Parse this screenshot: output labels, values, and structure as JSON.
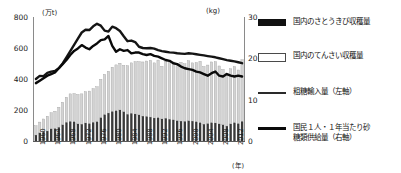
{
  "axes": {
    "left_unit": "(万t)",
    "right_unit": "(kg)",
    "x_unit": "(年)",
    "y_left_ticks": [
      "800",
      "600",
      "400",
      "200",
      "0"
    ],
    "y_right_ticks": [
      "30",
      "20",
      "10",
      "0"
    ],
    "x_ticks": [
      "1960",
      "1964",
      "1968",
      "1972",
      "1976",
      "1980",
      "1984",
      "1988",
      "1992",
      "1996",
      "2000",
      "2004",
      "2008",
      "2012"
    ]
  },
  "legend": {
    "items": [
      {
        "label": "国内のさとうきび収穫量",
        "key": "black-bar-swatch",
        "color": "#111111"
      },
      {
        "label": "国内のてんさい収穫量",
        "key": "white-bar-swatch",
        "color": "#ffffff"
      },
      {
        "label": "粗糖輸入量（左軸）",
        "key": "thin-line-swatch",
        "color": "#2a2a2a"
      },
      {
        "label": "国民１人・１年当たり砂\n糖類供給量（右軸）",
        "key": "thick-line-swatch",
        "color": "#0a0a0a"
      }
    ]
  },
  "chart_data": {
    "type": "bar",
    "title": "",
    "xlabel": "(年)",
    "ylabel": "(万t)",
    "ylabel_right": "(kg)",
    "ylim": [
      0,
      800
    ],
    "ylim_right": [
      0,
      30
    ],
    "grid": false,
    "legend_position": "right",
    "x": [
      1960,
      1961,
      1962,
      1963,
      1964,
      1965,
      1966,
      1967,
      1968,
      1969,
      1970,
      1971,
      1972,
      1973,
      1974,
      1975,
      1976,
      1977,
      1978,
      1979,
      1980,
      1981,
      1982,
      1983,
      1984,
      1985,
      1986,
      1987,
      1988,
      1989,
      1990,
      1991,
      1992,
      1993,
      1994,
      1995,
      1996,
      1997,
      1998,
      1999,
      2000,
      2001,
      2002,
      2003,
      2004,
      2005,
      2006,
      2007,
      2008,
      2009,
      2010,
      2011,
      2012,
      2013,
      2014
    ],
    "series": [
      {
        "name": "国内のさとうきび収穫量",
        "axis": "left",
        "unit": "万t",
        "style": "bar-black",
        "values": [
          38,
          52,
          60,
          64,
          78,
          80,
          88,
          104,
          120,
          126,
          124,
          110,
          108,
          116,
          112,
          120,
          124,
          150,
          170,
          180,
          190,
          195,
          200,
          188,
          172,
          178,
          174,
          168,
          160,
          158,
          154,
          148,
          150,
          142,
          146,
          140,
          136,
          130,
          128,
          126,
          130,
          128,
          124,
          118,
          108,
          112,
          118,
          116,
          110,
          104,
          96,
          110,
          118,
          112,
          126
        ]
      },
      {
        "name": "国内のてんさい収穫量",
        "axis": "left",
        "unit": "万t",
        "style": "bar-white",
        "values": [
          60,
          70,
          82,
          96,
          104,
          112,
          130,
          146,
          162,
          178,
          182,
          190,
          196,
          202,
          210,
          218,
          226,
          248,
          260,
          270,
          286,
          296,
          302,
          300,
          314,
          326,
          338,
          344,
          350,
          358,
          366,
          356,
          372,
          340,
          368,
          380,
          374,
          366,
          380,
          372,
          388,
          376,
          382,
          396,
          372,
          378,
          392,
          396,
          374,
          358,
          342,
          356,
          362,
          346,
          398
        ]
      },
      {
        "name": "粗糖輸入量（左軸）",
        "axis": "left",
        "unit": "万t",
        "style": "line-thin",
        "values": [
          400,
          420,
          418,
          440,
          448,
          452,
          470,
          500,
          540,
          580,
          620,
          660,
          700,
          718,
          716,
          740,
          756,
          744,
          712,
          706,
          738,
          728,
          710,
          676,
          644,
          648,
          638,
          608,
          600,
          598,
          600,
          596,
          586,
          580,
          576,
          572,
          570,
          566,
          564,
          562,
          566,
          564,
          560,
          556,
          552,
          548,
          544,
          540,
          534,
          528,
          522,
          518,
          514,
          508,
          502
        ]
      },
      {
        "name": "国民１人・１年当たり砂糖類供給量（右軸）",
        "axis": "right",
        "unit": "kg",
        "style": "line-thick",
        "values": [
          14.0,
          14.6,
          15.2,
          15.8,
          16.2,
          16.6,
          17.6,
          18.6,
          19.6,
          20.8,
          21.8,
          22.4,
          23.2,
          22.6,
          22.2,
          23.0,
          23.6,
          24.4,
          24.6,
          25.4,
          23.0,
          21.6,
          22.2,
          21.8,
          22.0,
          21.2,
          21.4,
          21.4,
          21.0,
          20.8,
          21.0,
          20.6,
          20.4,
          20.0,
          19.6,
          19.4,
          18.8,
          18.6,
          18.0,
          17.6,
          17.4,
          17.2,
          16.8,
          16.6,
          16.2,
          15.8,
          16.4,
          16.8,
          15.8,
          15.6,
          16.2,
          15.8,
          15.6,
          15.8,
          15.6
        ]
      }
    ]
  }
}
